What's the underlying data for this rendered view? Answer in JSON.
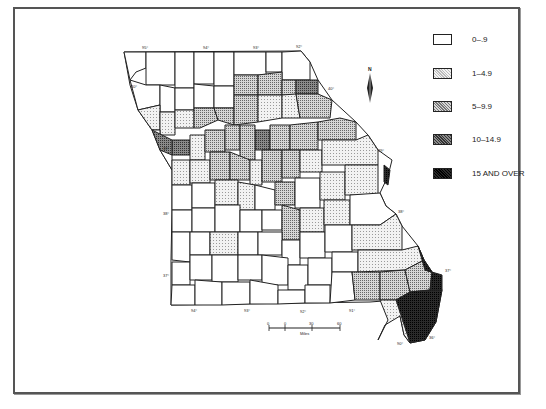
{
  "map": {
    "subject": "Missouri counties",
    "longitude_labels_top": [
      "95°",
      "94°",
      "93°",
      "92°"
    ],
    "longitude_labels_bottom": [
      "94°",
      "93°",
      "92°",
      "91°",
      "90°"
    ],
    "latitude_labels": [
      "40°",
      "39°",
      "38°",
      "37°",
      "36°"
    ],
    "north_arrow_label": "N",
    "scale_bar": {
      "ticks": [
        "0",
        "0",
        "30",
        "60"
      ],
      "unit": "Miles"
    }
  },
  "legend": {
    "items": [
      {
        "label": "0–.9",
        "fill": "#ffffff"
      },
      {
        "label": "1–4.9",
        "fill": "#e6e6e6"
      },
      {
        "label": "5–9.9",
        "fill": "#bdbdbd"
      },
      {
        "label": "10–14.9",
        "fill": "#7a7a7a"
      },
      {
        "label": "15 AND OVER",
        "fill": "#1a1a1a"
      }
    ]
  }
}
